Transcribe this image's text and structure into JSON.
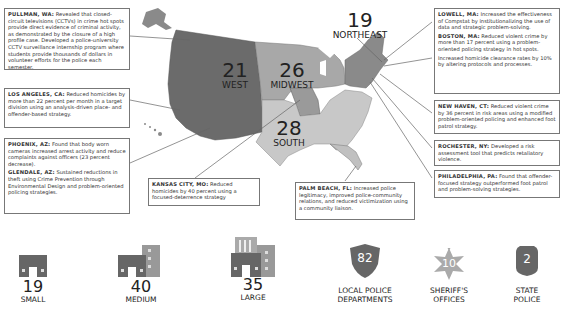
{
  "colors": {
    "west": "#6b6b6b",
    "midwest": "#a8a8a8",
    "south": "#c8c8c8",
    "northeast": "#8a8a8a",
    "box_border": "#777777",
    "icon_dark": "#666666",
    "icon_light": "#999999"
  },
  "regions": [
    {
      "id": "west",
      "count": "21",
      "name": "WEST"
    },
    {
      "id": "midwest",
      "count": "26",
      "name": "MIDWEST"
    },
    {
      "id": "south",
      "count": "28",
      "name": "SOUTH"
    },
    {
      "id": "northeast",
      "count": "19",
      "name": "NORTHEAST"
    }
  ],
  "callouts": {
    "pullman": {
      "city": "PULLMAN, WA:",
      "text": " Revealed that closed-circuit televisions (CCTVs) in crime hot spots provide direct evidence of criminal activity, as demonstrated by the closure of a high profile case. Developed a police-university CCTV surveillance internship program where students provide thousands of dollars in volunteer efforts for the police each semester."
    },
    "los_angeles": {
      "city": "LOS ANGELES, CA:",
      "text": " Reduced homicides by more than 22 percent per month in a target division using an analysis-driven place- and offender-based strategy."
    },
    "phoenix": {
      "city": "PHOENIX, AZ:",
      "text": " Found that body worn cameras increased arrest activity and  reduce complaints against officers (23 percent decrease)."
    },
    "glendale": {
      "city": "GLENDALE, AZ:",
      "text": " Sustained reductions in theft using  Crime Prevention through Environmental Design and problem-oriented policing strategies."
    },
    "kansas_city": {
      "city": "KANSAS CITY, MO:",
      "text": " Reduced homicides by 40 percent using a focused-deterrence strategy"
    },
    "palm_beach": {
      "city": "PALM BEACH, FL:",
      "text": " Increased police legitimacy, improved police-community relations, and reduced victimization using a community liaison."
    },
    "lowell": {
      "city": "LOWELL, MA:",
      "text": " Increased the effectiveness of Compstat by institutionalizing the use of data and strategic problem-solving."
    },
    "boston": {
      "city": "BOSTON, MA:",
      "text": " Reduced violent crime by more than 17 percent using a problem-oriented policing strategy in hot spots.",
      "extra": "Increased homicide clearance rates by 10% by altering protocols and processes."
    },
    "new_haven": {
      "city": "NEW HAVEN, CT:",
      "text": " Reduced violent crime by 36 percent in risk areas using a modified problem-oriented policing and enhanced foot patrol strategy."
    },
    "rochester": {
      "city": "ROCHESTER, NY:",
      "text": " Developed a risk assessment tool that predicts retaliatory violence."
    },
    "philadelphia": {
      "city": "PHILADELPHIA, PA:",
      "text": " Found that offender-focused strategy outperformed foot patrol and problem-solving strategies."
    }
  },
  "stats": [
    {
      "id": "small",
      "count": "19",
      "label": "SMALL",
      "icon": "small-building-icon"
    },
    {
      "id": "medium",
      "count": "40",
      "label": "MEDIUM",
      "icon": "medium-building-icon"
    },
    {
      "id": "large",
      "count": "35",
      "label": "LARGE",
      "icon": "large-building-icon"
    },
    {
      "id": "local",
      "count": "82",
      "label_line1": "LOCAL POLICE",
      "label_line2": "DEPARTMENTS",
      "icon": "police-shield-icon"
    },
    {
      "id": "sheriff",
      "count": "10",
      "label_line1": "SHERIFF'S",
      "label_line2": "OFFICES",
      "icon": "sheriff-star-icon"
    },
    {
      "id": "state",
      "count": "2",
      "label_line1": "STATE",
      "label_line2": "POLICE",
      "icon": "state-badge-icon"
    }
  ]
}
